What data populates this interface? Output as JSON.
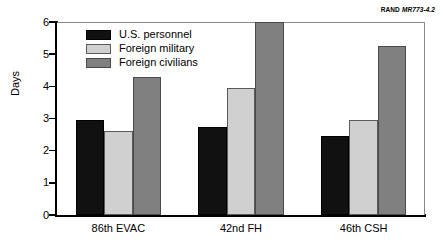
{
  "figure_id": {
    "organization": "RAND",
    "number": "MR773-4.2"
  },
  "chart_data": {
    "type": "bar",
    "title": "",
    "xlabel": "",
    "ylabel": "Days",
    "ylim": [
      0,
      6
    ],
    "yticks": [
      "0",
      "1",
      "2",
      "3",
      "4",
      "5",
      "6"
    ],
    "grid": false,
    "legend_position": "top-left-inside",
    "categories": [
      "86th EVAC",
      "42nd FH",
      "46th CSH"
    ],
    "series": [
      {
        "name": "U.S. personnel",
        "color": "#111111",
        "values": [
          2.95,
          2.75,
          2.45
        ]
      },
      {
        "name": "Foreign military",
        "color": "#d0d0d0",
        "values": [
          2.6,
          3.95,
          2.95
        ]
      },
      {
        "name": "Foreign civilians",
        "color": "#808080",
        "values": [
          4.3,
          6.0,
          5.25
        ]
      }
    ]
  }
}
